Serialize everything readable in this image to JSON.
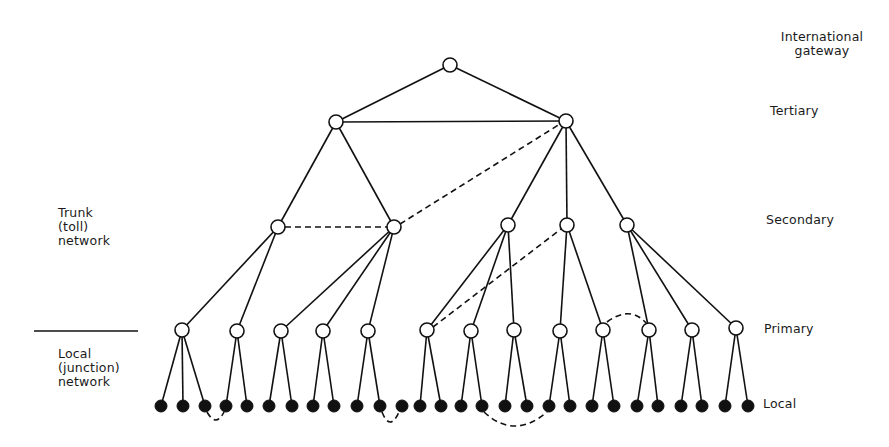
{
  "diagram": {
    "level_labels": {
      "international": [
        "International",
        "gateway"
      ],
      "tertiary": "Tertiary",
      "secondary": "Secondary",
      "primary": "Primary",
      "local": "Local"
    },
    "section_labels": {
      "trunk": [
        "Trunk",
        "(toll)",
        "network"
      ],
      "local": [
        "Local",
        "(junction)",
        "network"
      ]
    },
    "colors": {
      "line": "#111111",
      "open_node_fill": "#ffffff",
      "filled_node": "#111111"
    },
    "nodes": {
      "international": [
        [
          450,
          65
        ]
      ],
      "tertiary": [
        [
          336,
          122
        ],
        [
          566,
          121
        ]
      ],
      "secondary": [
        [
          278,
          227
        ],
        [
          394,
          227
        ],
        [
          508,
          225
        ],
        [
          567,
          225
        ],
        [
          627,
          225
        ]
      ],
      "primary": [
        [
          182,
          330
        ],
        [
          237,
          331
        ],
        [
          281,
          331
        ],
        [
          323,
          331
        ],
        [
          368,
          331
        ],
        [
          427,
          330
        ],
        [
          471,
          331
        ],
        [
          514,
          330
        ],
        [
          560,
          331
        ],
        [
          603,
          330
        ],
        [
          649,
          330
        ],
        [
          692,
          330
        ],
        [
          736,
          328
        ]
      ],
      "local": [
        [
          161,
          406
        ],
        [
          183,
          406
        ],
        [
          205,
          406
        ],
        [
          226,
          406
        ],
        [
          247,
          406
        ],
        [
          269,
          406
        ],
        [
          292,
          406
        ],
        [
          313,
          406
        ],
        [
          334,
          406
        ],
        [
          357,
          406
        ],
        [
          380,
          406
        ],
        [
          402,
          406
        ],
        [
          420,
          406
        ],
        [
          441,
          406
        ],
        [
          461,
          406
        ],
        [
          482,
          406
        ],
        [
          505,
          406
        ],
        [
          527,
          406
        ],
        [
          549,
          406
        ],
        [
          570,
          406
        ],
        [
          592,
          406
        ],
        [
          614,
          406
        ],
        [
          637,
          406
        ],
        [
          658,
          406
        ],
        [
          681,
          406
        ],
        [
          702,
          406
        ],
        [
          725,
          406
        ],
        [
          748,
          406
        ]
      ]
    },
    "solid_edges": [
      [
        [
          450,
          65
        ],
        [
          336,
          122
        ]
      ],
      [
        [
          450,
          65
        ],
        [
          566,
          121
        ]
      ],
      [
        [
          336,
          122
        ],
        [
          566,
          121
        ]
      ],
      [
        [
          336,
          122
        ],
        [
          278,
          227
        ]
      ],
      [
        [
          336,
          122
        ],
        [
          394,
          227
        ]
      ],
      [
        [
          566,
          121
        ],
        [
          508,
          225
        ]
      ],
      [
        [
          566,
          121
        ],
        [
          567,
          225
        ]
      ],
      [
        [
          566,
          121
        ],
        [
          627,
          225
        ]
      ],
      [
        [
          278,
          227
        ],
        [
          182,
          330
        ]
      ],
      [
        [
          278,
          227
        ],
        [
          237,
          331
        ]
      ],
      [
        [
          394,
          227
        ],
        [
          281,
          331
        ]
      ],
      [
        [
          394,
          227
        ],
        [
          323,
          331
        ]
      ],
      [
        [
          394,
          227
        ],
        [
          368,
          331
        ]
      ],
      [
        [
          508,
          225
        ],
        [
          427,
          330
        ]
      ],
      [
        [
          508,
          225
        ],
        [
          471,
          331
        ]
      ],
      [
        [
          508,
          225
        ],
        [
          514,
          330
        ]
      ],
      [
        [
          567,
          225
        ],
        [
          560,
          331
        ]
      ],
      [
        [
          567,
          225
        ],
        [
          603,
          330
        ]
      ],
      [
        [
          627,
          225
        ],
        [
          649,
          330
        ]
      ],
      [
        [
          627,
          225
        ],
        [
          692,
          330
        ]
      ],
      [
        [
          627,
          225
        ],
        [
          736,
          328
        ]
      ],
      [
        [
          182,
          330
        ],
        [
          161,
          406
        ]
      ],
      [
        [
          182,
          330
        ],
        [
          183,
          406
        ]
      ],
      [
        [
          182,
          330
        ],
        [
          205,
          406
        ]
      ],
      [
        [
          237,
          331
        ],
        [
          226,
          406
        ]
      ],
      [
        [
          237,
          331
        ],
        [
          247,
          406
        ]
      ],
      [
        [
          281,
          331
        ],
        [
          269,
          406
        ]
      ],
      [
        [
          281,
          331
        ],
        [
          292,
          406
        ]
      ],
      [
        [
          323,
          331
        ],
        [
          313,
          406
        ]
      ],
      [
        [
          323,
          331
        ],
        [
          334,
          406
        ]
      ],
      [
        [
          368,
          331
        ],
        [
          357,
          406
        ]
      ],
      [
        [
          368,
          331
        ],
        [
          380,
          406
        ]
      ],
      [
        [
          427,
          330
        ],
        [
          420,
          406
        ]
      ],
      [
        [
          427,
          330
        ],
        [
          441,
          406
        ]
      ],
      [
        [
          471,
          331
        ],
        [
          461,
          406
        ]
      ],
      [
        [
          471,
          331
        ],
        [
          482,
          406
        ]
      ],
      [
        [
          514,
          330
        ],
        [
          505,
          406
        ]
      ],
      [
        [
          514,
          330
        ],
        [
          527,
          406
        ]
      ],
      [
        [
          560,
          331
        ],
        [
          549,
          406
        ]
      ],
      [
        [
          560,
          331
        ],
        [
          570,
          406
        ]
      ],
      [
        [
          603,
          330
        ],
        [
          592,
          406
        ]
      ],
      [
        [
          603,
          330
        ],
        [
          614,
          406
        ]
      ],
      [
        [
          649,
          330
        ],
        [
          637,
          406
        ]
      ],
      [
        [
          649,
          330
        ],
        [
          658,
          406
        ]
      ],
      [
        [
          692,
          330
        ],
        [
          681,
          406
        ]
      ],
      [
        [
          692,
          330
        ],
        [
          702,
          406
        ]
      ],
      [
        [
          736,
          328
        ],
        [
          725,
          406
        ]
      ],
      [
        [
          736,
          328
        ],
        [
          748,
          406
        ]
      ]
    ],
    "dashed_edges": [
      "M 285 227 L 387 227",
      "M 400 224 L 560 124",
      "M 433 327 L 561 229",
      "M 607 322 Q 630 305 646 323",
      "M 207 412 Q 216 428 224 412",
      "M 382 412 Q 390 432 399 412",
      "M 484 412 Q 514 440 547 412"
    ]
  }
}
